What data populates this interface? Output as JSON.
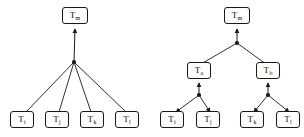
{
  "figure": {
    "title": "",
    "background_color": "#ffffff",
    "stroke_color": "#1a1a1a",
    "diagrams": [
      {
        "id": "left",
        "name": "flat-star-topology",
        "root": {
          "id": "l-m",
          "base": "T",
          "subscript": "m",
          "x": 75,
          "y": 18
        },
        "junctions": [
          {
            "id": "l-j1",
            "x": 74,
            "y": 62
          }
        ],
        "leaves": [
          {
            "id": "l-i",
            "base": "T",
            "subscript": "i",
            "x": 22,
            "y": 120
          },
          {
            "id": "l-j",
            "base": "T",
            "subscript": "j",
            "x": 57,
            "y": 120
          },
          {
            "id": "l-k",
            "base": "T",
            "subscript": "k",
            "x": 92,
            "y": 120
          },
          {
            "id": "l-l",
            "base": "T",
            "subscript": "l",
            "x": 127,
            "y": 120
          }
        ]
      },
      {
        "id": "right",
        "name": "hierarchical-tree-topology",
        "root": {
          "id": "r-m",
          "base": "T",
          "subscript": "m",
          "x": 237,
          "y": 18
        },
        "junctions": [
          {
            "id": "r-j0",
            "x": 237,
            "y": 43
          },
          {
            "id": "r-ja",
            "x": 199,
            "y": 95
          },
          {
            "id": "r-jb",
            "x": 268,
            "y": 95
          }
        ],
        "intermediates": [
          {
            "id": "r-a",
            "base": "T",
            "subscript": "a",
            "x": 199,
            "y": 72
          },
          {
            "id": "r-b",
            "base": "T",
            "subscript": "b",
            "x": 268,
            "y": 72
          }
        ],
        "leaves": [
          {
            "id": "r-i",
            "base": "T",
            "subscript": "i",
            "x": 172,
            "y": 120
          },
          {
            "id": "r-j",
            "base": "T",
            "subscript": "j",
            "x": 208,
            "y": 120
          },
          {
            "id": "r-k",
            "base": "T",
            "subscript": "k",
            "x": 252,
            "y": 120
          },
          {
            "id": "r-l",
            "base": "T",
            "subscript": "l",
            "x": 288,
            "y": 120
          }
        ]
      }
    ]
  }
}
